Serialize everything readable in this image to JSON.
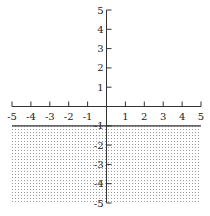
{
  "chart_data": {
    "type": "area",
    "title": "",
    "xlabel": "",
    "ylabel": "",
    "xlim": [
      -5,
      5
    ],
    "ylim": [
      -5,
      5
    ],
    "grid": false,
    "x_ticks": [
      -5,
      -4,
      -3,
      -2,
      -1,
      1,
      2,
      3,
      4,
      5
    ],
    "y_ticks": [
      5,
      4,
      3,
      2,
      1,
      -1,
      -2,
      -3,
      -4,
      -5
    ],
    "series": [
      {
        "name": "boundary line y = -1",
        "kind": "line",
        "style": "solid",
        "x": [
          -5,
          5
        ],
        "y": [
          -1,
          -1
        ]
      },
      {
        "name": "shaded region y <= -1",
        "kind": "region",
        "fill": "dotted",
        "x_range": [
          -5,
          5
        ],
        "y_range": [
          -5,
          -1
        ]
      }
    ],
    "annotations": []
  },
  "colors": {
    "axis": "#333333",
    "line": "#333333",
    "dots": "#9a9a9a",
    "background": "#ffffff"
  }
}
